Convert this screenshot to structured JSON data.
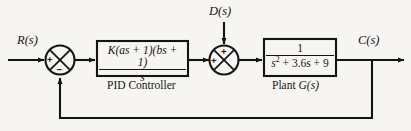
{
  "diagram": {
    "type": "control-system-block-diagram",
    "background_color": "#f7f5f1",
    "line_color": "#141414",
    "signals": {
      "reference": "R(s)",
      "disturbance": "D(s)",
      "output": "C(s)"
    },
    "summing_junctions": [
      {
        "name": "error-junction",
        "inputs": [
          {
            "from": "reference",
            "sign": "+",
            "position": "left"
          },
          {
            "from": "feedback",
            "sign": "−",
            "position": "bottom"
          }
        ]
      },
      {
        "name": "disturbance-junction",
        "inputs": [
          {
            "from": "controller",
            "sign": "+",
            "position": "left"
          },
          {
            "from": "disturbance",
            "sign": "+",
            "position": "top"
          }
        ]
      }
    ],
    "blocks": [
      {
        "name": "pid-controller",
        "caption": "PID Controller",
        "numerator": "K(as + 1)(bs + 1)",
        "denominator": "s"
      },
      {
        "name": "plant",
        "caption_prefix": "Plant ",
        "caption_italic": "G(s)",
        "numerator": "1",
        "denominator_pre": "s",
        "denominator_exp": "2",
        "denominator_post": " + 3.6s + 9"
      }
    ],
    "feedback": {
      "type": "unity",
      "description": "output tapped after plant, fed back to error junction"
    }
  }
}
